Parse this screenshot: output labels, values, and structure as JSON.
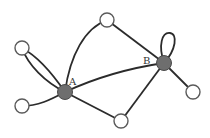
{
  "diagram": {
    "type": "graph",
    "labels": {
      "A": "A",
      "B": "B"
    },
    "nodes": [
      {
        "id": "A",
        "label": "A",
        "x": 65,
        "y": 92,
        "filled": true
      },
      {
        "id": "B",
        "label": "B",
        "x": 164,
        "y": 63,
        "filled": true
      },
      {
        "id": "n_top_left",
        "label": "",
        "x": 22,
        "y": 48,
        "filled": false
      },
      {
        "id": "n_top",
        "label": "",
        "x": 107,
        "y": 20,
        "filled": false
      },
      {
        "id": "n_bottom_left",
        "label": "",
        "x": 22,
        "y": 106,
        "filled": false
      },
      {
        "id": "n_bottom",
        "label": "",
        "x": 121,
        "y": 121,
        "filled": false
      },
      {
        "id": "n_right",
        "label": "",
        "x": 193,
        "y": 92,
        "filled": false
      }
    ],
    "edges": [
      {
        "from": "A",
        "to": "n_top_left",
        "style": "double-curve"
      },
      {
        "from": "A",
        "to": "n_bottom_left"
      },
      {
        "from": "A",
        "to": "n_top",
        "style": "curve"
      },
      {
        "from": "A",
        "to": "B"
      },
      {
        "from": "A",
        "to": "n_bottom"
      },
      {
        "from": "n_top",
        "to": "B"
      },
      {
        "from": "B",
        "to": "B",
        "style": "self-loop"
      },
      {
        "from": "B",
        "to": "n_right"
      },
      {
        "from": "B",
        "to": "n_bottom"
      }
    ],
    "colors": {
      "edge": "#2b2b2b",
      "filled_node": "#6e6e6e",
      "open_node_stroke": "#5a5a5a",
      "background": "#ffffff"
    }
  }
}
